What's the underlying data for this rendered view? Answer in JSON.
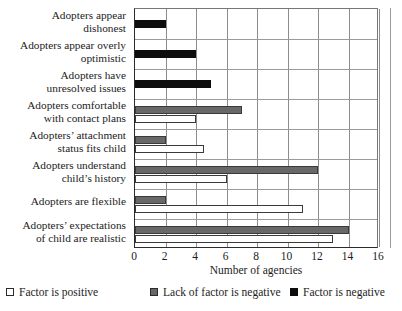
{
  "chart_data": {
    "type": "bar",
    "orientation": "horizontal",
    "title": "",
    "xlabel": "Number of agencies",
    "ylabel": "",
    "xlim": [
      0,
      16
    ],
    "xticks": [
      0,
      2,
      4,
      6,
      8,
      10,
      12,
      14,
      16
    ],
    "grid": true,
    "legend_position": "bottom",
    "categories": [
      "Adopters appear dishonest",
      "Adopters appear overly optimistic",
      "Adopters have unresolved issues",
      "Adopters comfortable with contact plans",
      "Adopters’ attachment status fits child",
      "Adopters understand child’s history",
      "Adopters are flexible",
      "Adopters’ expectations of child are realistic"
    ],
    "series": [
      {
        "name": "Factor is positive",
        "color": "#ffffff",
        "values": [
          null,
          null,
          null,
          4,
          4.5,
          6,
          11,
          13
        ]
      },
      {
        "name": "Lack of factor is negative",
        "color": "#686868",
        "values": [
          null,
          null,
          null,
          7,
          2,
          12,
          2,
          14
        ]
      },
      {
        "name": "Factor is negative",
        "color": "#0d0d0d",
        "values": [
          2,
          4,
          5,
          null,
          null,
          null,
          null,
          null
        ]
      }
    ]
  },
  "legend": {
    "items": [
      {
        "label": "Factor is positive",
        "swatch": "positive"
      },
      {
        "label": "Lack of factor is negative",
        "swatch": "lack"
      },
      {
        "label": "Factor is negative",
        "swatch": "negative"
      }
    ]
  },
  "axis": {
    "x_title": "Number of agencies",
    "tick_labels": [
      "0",
      "2",
      "4",
      "6",
      "8",
      "10",
      "12",
      "14",
      "16"
    ]
  },
  "category_labels": [
    [
      "Adopters appear",
      "dishonest"
    ],
    [
      "Adopters appear overly",
      "optimistic"
    ],
    [
      "Adopters have",
      "unresolved issues"
    ],
    [
      "Adopters comfortable",
      "with contact plans"
    ],
    [
      "Adopters’ attachment",
      "status fits child"
    ],
    [
      "Adopters understand",
      "child’s history"
    ],
    [
      "Adopters are flexible"
    ],
    [
      "Adopters’ expectations",
      "of child are realistic"
    ]
  ]
}
